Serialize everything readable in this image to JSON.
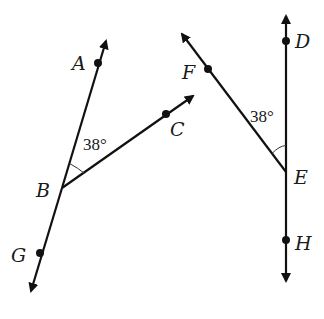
{
  "diagram": {
    "left_figure": {
      "line": {
        "name": "line AG",
        "points": [
          "A",
          "B",
          "G"
        ]
      },
      "ray": {
        "name": "ray BC",
        "vertex": "B",
        "through": "C"
      },
      "angle": {
        "name": "angle ABC",
        "label": "38°",
        "value_degrees": 38
      },
      "labels": {
        "A": "A",
        "B": "B",
        "C": "C",
        "G": "G"
      }
    },
    "right_figure": {
      "line": {
        "name": "line DH",
        "points": [
          "D",
          "E",
          "H"
        ]
      },
      "ray": {
        "name": "ray EF",
        "vertex": "E",
        "through": "F"
      },
      "angle": {
        "name": "angle FED",
        "label": "38°",
        "value_degrees": 38
      },
      "labels": {
        "D": "D",
        "E": "E",
        "F": "F",
        "H": "H"
      }
    },
    "colors": {
      "stroke": "#111111",
      "background": "#ffffff"
    }
  }
}
